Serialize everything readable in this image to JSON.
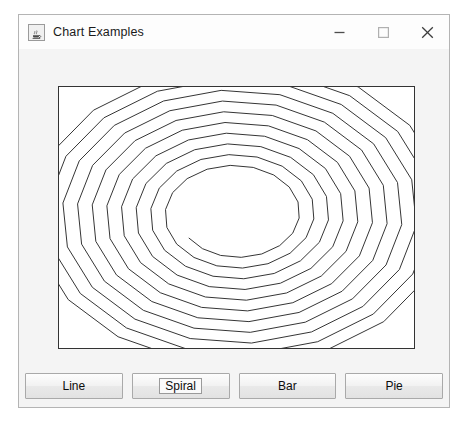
{
  "window": {
    "title": "Chart Examples",
    "icon": "java-coffee-cup-icon",
    "controls": [
      {
        "name": "minimize",
        "glyph": "minimize-icon"
      },
      {
        "name": "maximize",
        "glyph": "maximize-icon"
      },
      {
        "name": "close",
        "glyph": "close-icon"
      }
    ]
  },
  "colors": {
    "window_border": "#b4b4b4",
    "titlebar_bg": "#fdfdfd",
    "content_bg": "#f4f4f4",
    "panel_bg": "#ffffff",
    "panel_border": "#333333",
    "spiral_stroke": "#333333",
    "button_face": "#eeeeee",
    "button_border": "#a9a9a9",
    "text": "#1b1b1b"
  },
  "buttons": [
    {
      "label": "Line",
      "focused": false
    },
    {
      "label": "Spiral",
      "focused": true
    },
    {
      "label": "Bar",
      "focused": false
    },
    {
      "label": "Pie",
      "focused": false
    }
  ],
  "chart_data": {
    "type": "line",
    "title": "",
    "subtitle": "",
    "xlabel": "",
    "ylabel": "",
    "grid": false,
    "legend": false,
    "plot_area": {
      "x": 0,
      "y": 0,
      "width": 357,
      "height": 263
    },
    "center": {
      "x": 178,
      "y": 128
    },
    "segments_per_turn": 18,
    "angle_step_deg": 20,
    "turns": 10.6,
    "radius_x_start": 215,
    "radius_y_start": 157,
    "radius_x_end": 58,
    "radius_y_end": 42,
    "start_angle_deg": -75,
    "direction": "clockwise",
    "stroke_width": 1,
    "jitter": 0.0,
    "xlim": [
      0,
      357
    ],
    "ylim": [
      0,
      263
    ]
  }
}
